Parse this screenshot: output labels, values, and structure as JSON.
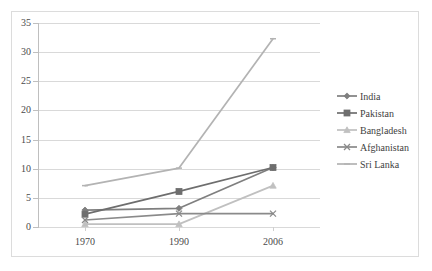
{
  "chart_data": {
    "type": "line",
    "title": "",
    "subtitle": "",
    "xlabel": "",
    "ylabel": "",
    "categories": [
      "1970",
      "1990",
      "2006"
    ],
    "ylim": [
      0,
      35
    ],
    "ytick_step": 5,
    "yticks": [
      "0",
      "5",
      "10",
      "15",
      "20",
      "25",
      "30",
      "35"
    ],
    "grid": true,
    "legend_position": "right",
    "series": [
      {
        "name": "India",
        "marker": "diamond",
        "color": "#7f7f7f",
        "values": [
          2.9,
          3.2,
          10.2
        ]
      },
      {
        "name": "Pakistan",
        "marker": "square",
        "color": "#6e6e6e",
        "values": [
          2.2,
          6.1,
          10.2
        ]
      },
      {
        "name": "Bangladesh",
        "marker": "triangle",
        "color": "#c0c0c0",
        "values": [
          0.5,
          0.5,
          7.1
        ]
      },
      {
        "name": "Afghanistan",
        "marker": "cross",
        "color": "#8a8a8a",
        "values": [
          1.2,
          2.3,
          2.3
        ]
      },
      {
        "name": "Sri Lanka",
        "marker": "line",
        "color": "#b3b3b3",
        "values": [
          7.1,
          10.1,
          32.3
        ]
      }
    ]
  },
  "legend": {
    "items": [
      {
        "label": "India"
      },
      {
        "label": "Pakistan"
      },
      {
        "label": "Bangladesh"
      },
      {
        "label": "Afghanistan"
      },
      {
        "label": "Sri Lanka"
      }
    ]
  }
}
